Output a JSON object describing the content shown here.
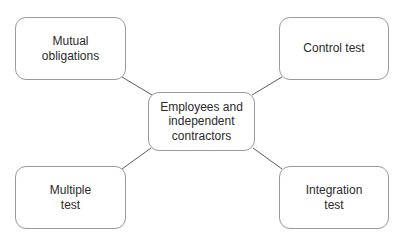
{
  "diagram": {
    "type": "mind-map",
    "center": {
      "label": "Employees and\nindependent\ncontractors"
    },
    "nodes": [
      {
        "id": "mutual",
        "label": "Mutual\nobligations",
        "position": "top-left"
      },
      {
        "id": "control",
        "label": "Control test",
        "position": "top-right"
      },
      {
        "id": "multiple",
        "label": "Multiple\ntest",
        "position": "bottom-left"
      },
      {
        "id": "integration",
        "label": "Integration\ntest",
        "position": "bottom-right"
      }
    ],
    "edges": [
      {
        "from": "center",
        "to": "mutual"
      },
      {
        "from": "center",
        "to": "control"
      },
      {
        "from": "center",
        "to": "multiple"
      },
      {
        "from": "center",
        "to": "integration"
      }
    ],
    "colors": {
      "border": "#9a9a9a",
      "line": "#5a5a5a",
      "text": "#2a2a2a",
      "background": "#ffffff"
    }
  }
}
